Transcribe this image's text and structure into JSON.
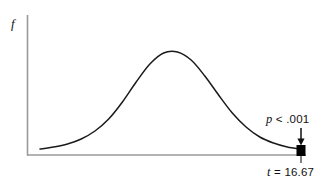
{
  "figure": {
    "background_color": "#ffffff",
    "width": 336,
    "height": 186,
    "axis_color": "#9a9a9a",
    "curve_color": "#1a1a1a",
    "marker_color": "#000000",
    "y_axis_label": "f",
    "annotations": {
      "p_value": {
        "symbol": "p",
        "text": " < .001"
      },
      "t_value": {
        "symbol": "t",
        "text": " = 16.67"
      }
    }
  },
  "chart_data": {
    "type": "line",
    "title": "",
    "xlabel": "",
    "ylabel": "f",
    "grid": false,
    "legend": "none",
    "xlim": [
      0,
      1
    ],
    "ylim": [
      0,
      1
    ],
    "series": [
      {
        "name": "density",
        "x": [
          0.05,
          0.1,
          0.15,
          0.2,
          0.25,
          0.3,
          0.35,
          0.4,
          0.45,
          0.5,
          0.55,
          0.6,
          0.65,
          0.7,
          0.75,
          0.8,
          0.85,
          0.9,
          0.95,
          1.0
        ],
        "y": [
          0.03,
          0.05,
          0.08,
          0.13,
          0.21,
          0.33,
          0.5,
          0.7,
          0.88,
          0.99,
          1.0,
          0.92,
          0.76,
          0.57,
          0.39,
          0.25,
          0.15,
          0.09,
          0.05,
          0.03
        ]
      }
    ],
    "annotations": [
      {
        "label": "p < .001",
        "points_to": "critical-region-marker",
        "position": "above-right-tail"
      },
      {
        "label": "t = 16.67",
        "points_to": "x-axis-tick",
        "position": "below-axis-right"
      }
    ],
    "markers": [
      {
        "name": "critical-region-marker",
        "shape": "square",
        "color": "#000000",
        "x": 1.0,
        "y": 0.0
      }
    ]
  }
}
